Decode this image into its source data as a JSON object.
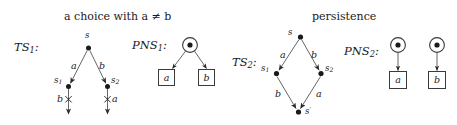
{
  "figure": {
    "width": 457,
    "height": 125,
    "background": "#ffffff",
    "ink": "#1a1a1a",
    "stroke": "#555555"
  },
  "captions": {
    "left": "a choice with a ≠ b",
    "right": "persistence"
  },
  "systems": {
    "ts1": {
      "label": "TS",
      "label_sub": "1",
      "label_colon": ":",
      "nodes": [
        {
          "name": "s",
          "id": "s",
          "sub": "",
          "x": 88,
          "y": 48
        },
        {
          "name": "s1",
          "id": "s",
          "sub": "1",
          "x": 68,
          "y": 86
        },
        {
          "name": "s2",
          "id": "s",
          "sub": "2",
          "x": 108,
          "y": 86
        }
      ],
      "edges": [
        {
          "label": "a",
          "from": "s",
          "to": "s1",
          "crossed": false
        },
        {
          "label": "b",
          "from": "s",
          "to": "s2",
          "crossed": false
        },
        {
          "label": "b",
          "from": "s1",
          "to": "dangling-left",
          "crossed": true
        },
        {
          "label": "a",
          "from": "s2",
          "to": "dangling-right",
          "crossed": true
        }
      ]
    },
    "pns1": {
      "label": "PNS",
      "label_sub": "1",
      "label_colon": ":",
      "places": [
        {
          "name": "place-p",
          "tokens": 1,
          "x": 190,
          "y": 45
        }
      ],
      "transitions": [
        {
          "name": "transition-a",
          "label": "a",
          "x": 166,
          "y": 75
        },
        {
          "name": "transition-b",
          "label": "b",
          "x": 206,
          "y": 75
        }
      ],
      "arcs": [
        {
          "from": "place-p",
          "to": "transition-a"
        },
        {
          "from": "place-p",
          "to": "transition-b"
        }
      ]
    },
    "ts2": {
      "label": "TS",
      "label_sub": "2",
      "label_colon": ":",
      "nodes": [
        {
          "name": "s",
          "id": "s",
          "sub": "",
          "prime": "",
          "x": 300,
          "y": 37
        },
        {
          "name": "s1",
          "id": "s",
          "sub": "1",
          "prime": "",
          "x": 276,
          "y": 73
        },
        {
          "name": "s2",
          "id": "s",
          "sub": "2",
          "prime": "",
          "x": 320,
          "y": 73
        },
        {
          "name": "sprime",
          "id": "s",
          "sub": "",
          "prime": "′",
          "x": 298,
          "y": 112
        }
      ],
      "edges": [
        {
          "label": "a",
          "from": "s",
          "to": "s1"
        },
        {
          "label": "b",
          "from": "s",
          "to": "s2"
        },
        {
          "label": "b",
          "from": "s1",
          "to": "sprime"
        },
        {
          "label": "a",
          "from": "s2",
          "to": "sprime"
        }
      ]
    },
    "pns2": {
      "label": "PNS",
      "label_sub": "2",
      "label_colon": ":",
      "places": [
        {
          "name": "place-pa",
          "tokens": 1,
          "x": 398,
          "y": 45
        },
        {
          "name": "place-pb",
          "tokens": 1,
          "x": 437,
          "y": 45
        }
      ],
      "transitions": [
        {
          "name": "transition-a",
          "label": "a",
          "x": 398,
          "y": 78
        },
        {
          "name": "transition-b",
          "label": "b",
          "x": 437,
          "y": 78
        }
      ],
      "arcs": [
        {
          "from": "place-pa",
          "to": "transition-a"
        },
        {
          "from": "place-pb",
          "to": "transition-b"
        }
      ]
    }
  },
  "glyphs": {
    "cross": "×",
    "token": "●"
  },
  "edge_labels": {
    "ts1_a": "a",
    "ts1_b": "b",
    "ts1_bottom_left": "b",
    "ts1_bottom_right": "a",
    "ts2_a_top": "a",
    "ts2_b_top": "b",
    "ts2_b_bottom": "b",
    "ts2_a_bottom": "a"
  },
  "box_labels": {
    "pns1_a": "a",
    "pns1_b": "b",
    "pns2_a": "a",
    "pns2_b": "b"
  }
}
